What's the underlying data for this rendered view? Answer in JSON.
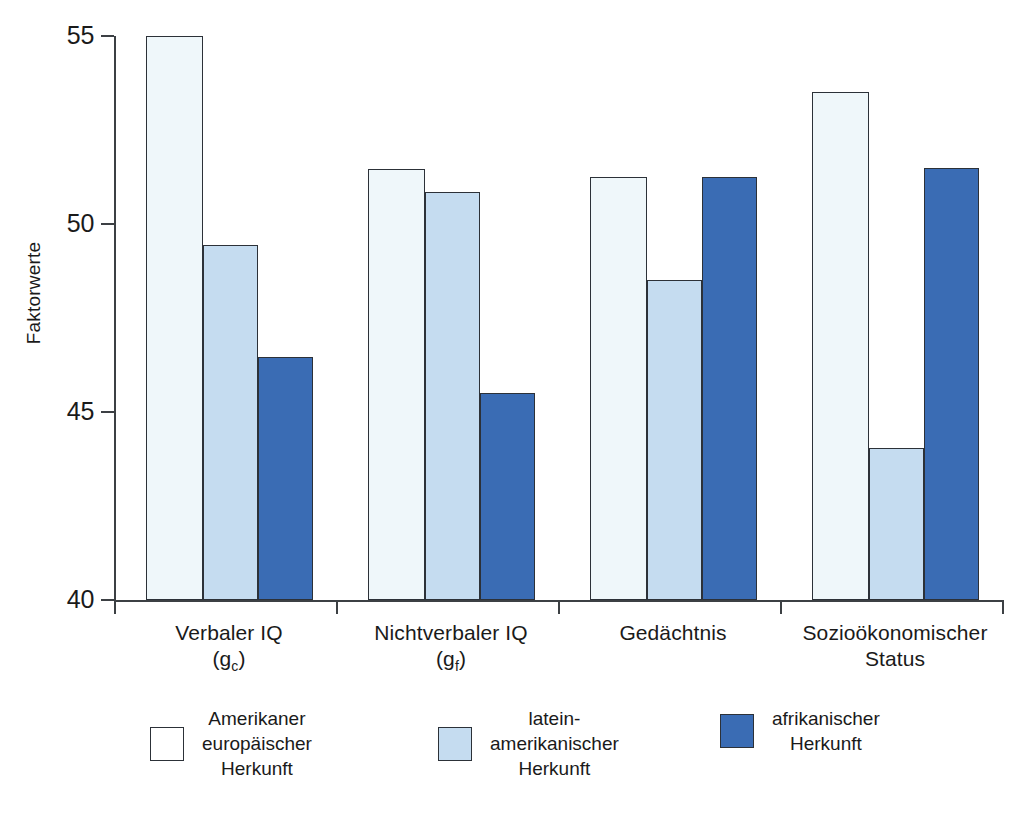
{
  "chart_data": {
    "type": "bar",
    "title": "",
    "xlabel": "",
    "ylabel": "Faktorwerte",
    "ylim": [
      40,
      55
    ],
    "yticks": [
      40,
      45,
      50,
      55
    ],
    "grid": false,
    "legend_position": "bottom",
    "categories": [
      "Verbaler IQ (g_c)",
      "Nichtverbaler IQ (g_f)",
      "Gedächtnis",
      "Sozioökonomischer Status"
    ],
    "series": [
      {
        "name": "Amerikaner europäischer Herkunft",
        "color": "#eff7fa",
        "values": [
          55.0,
          51.45,
          51.25,
          53.5
        ]
      },
      {
        "name": "lateinamerikanischer Herkunft",
        "color": "#c5dcf0",
        "values": [
          49.45,
          50.85,
          48.5,
          44.05
        ]
      },
      {
        "name": "afrikanischer Herkunft",
        "color": "#3a6cb4",
        "values": [
          46.45,
          45.5,
          51.25,
          51.5
        ]
      }
    ]
  },
  "axes": {
    "y_title": "Faktorwerte",
    "y_ticks": [
      {
        "label": "55",
        "value": 55
      },
      {
        "label": "50",
        "value": 50
      },
      {
        "label": "45",
        "value": 45
      },
      {
        "label": "40",
        "value": 40
      }
    ]
  },
  "categories": [
    {
      "line1": "Verbaler IQ",
      "line2_open": "(g",
      "line2_sub": "c",
      "line2_close": ")"
    },
    {
      "line1": "Nichtverbaler IQ",
      "line2_open": "(g",
      "line2_sub": "f",
      "line2_close": ")"
    },
    {
      "line1": "Gedächtnis",
      "line2_open": "",
      "line2_sub": "",
      "line2_close": ""
    },
    {
      "line1": "Sozioökonomischer",
      "line2_open": "Status",
      "line2_sub": "",
      "line2_close": ""
    }
  ],
  "legend": {
    "items": [
      {
        "label": "Amerikaner\neuropäischer\nHerkunft",
        "color": "#ffffff"
      },
      {
        "label": "latein-\namerikanischer\nHerkunft",
        "color": "#c5dcf0"
      },
      {
        "label": "afrikanischer\nHerkunft",
        "color": "#3a6cb4"
      }
    ]
  },
  "colors": {
    "series_white": "#eff7fa",
    "series_light_blue": "#c5dcf0",
    "series_dark_blue": "#3a6cb4",
    "axis": "#3c4044",
    "outline": "#2c3138"
  }
}
